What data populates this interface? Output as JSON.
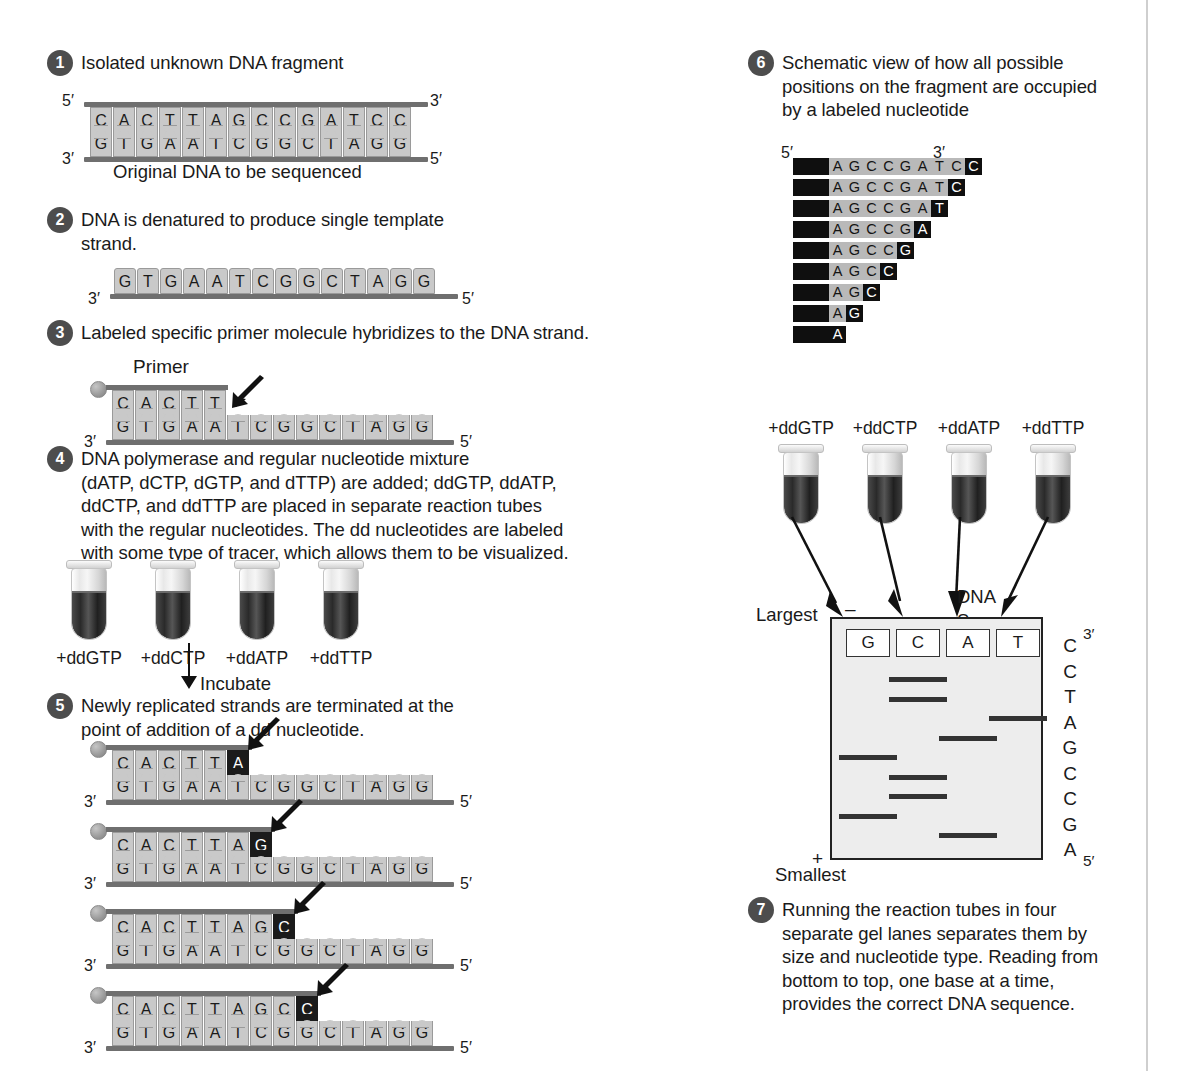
{
  "steps": {
    "s1": {
      "num": "1",
      "text": "Isolated unknown DNA fragment"
    },
    "s2": {
      "num": "2",
      "text": "DNA is denatured to produce single template\nstrand."
    },
    "s3": {
      "num": "3",
      "text": "Labeled specific primer molecule hybridizes to the DNA strand."
    },
    "s4": {
      "num": "4",
      "text": "DNA polymerase and regular nucleotide mixture\n(dATP, dCTP, dGTP, and dTTP) are added; ddGTP, ddATP,\nddCTP, and ddTTP are placed in separate reaction tubes\nwith the regular nucleotides. The dd nucleotides are labeled\nwith some type of tracer, which allows them to be visualized."
    },
    "s5": {
      "num": "5",
      "text": "Newly replicated strands are terminated at the\npoint of addition of a dd nucleotide."
    },
    "s6": {
      "num": "6",
      "text": "Schematic view of how all possible\npositions on the fragment are occupied\nby a labeled nucleotide"
    },
    "s7": {
      "num": "7",
      "text": "Running the reaction tubes in four\nseparate gel lanes separates them by\nsize and nucleotide type. Reading from\nbottom to top, one base at a time,\nprovides the correct DNA sequence."
    }
  },
  "labels": {
    "original_dna": "Original DNA to be sequenced",
    "primer": "Primer",
    "incubate": "Incubate",
    "largest": "Largest",
    "smallest": "Smallest",
    "dna_sequence": "DNA\nSequence",
    "five_prime": "5′",
    "three_prime": "3′",
    "minus": "–",
    "plus": "+"
  },
  "duplex": {
    "top": [
      "C",
      "A",
      "C",
      "T",
      "T",
      "A",
      "G",
      "C",
      "C",
      "G",
      "A",
      "T",
      "C",
      "C"
    ],
    "bottom": [
      "G",
      "T",
      "G",
      "A",
      "A",
      "T",
      "C",
      "G",
      "G",
      "C",
      "T",
      "A",
      "G",
      "G"
    ]
  },
  "template": {
    "bases": [
      "G",
      "T",
      "G",
      "A",
      "A",
      "T",
      "C",
      "G",
      "G",
      "C",
      "T",
      "A",
      "G",
      "G"
    ]
  },
  "primer_step3": {
    "primer_bases": [
      "C",
      "A",
      "C",
      "T",
      "T"
    ],
    "template_bases": [
      "G",
      "T",
      "G",
      "A",
      "A",
      "T",
      "C",
      "G",
      "G",
      "C",
      "T",
      "A",
      "G",
      "G"
    ]
  },
  "tubes": {
    "labels": [
      "+ddGTP",
      "+ddCTP",
      "+ddATP",
      "+ddTTP"
    ]
  },
  "step5_strands": [
    {
      "new": [
        "C",
        "A",
        "C",
        "T",
        "T",
        "A"
      ],
      "terminal_index": 5,
      "template": [
        "G",
        "T",
        "G",
        "A",
        "A",
        "T",
        "C",
        "G",
        "G",
        "C",
        "T",
        "A",
        "G",
        "G"
      ]
    },
    {
      "new": [
        "C",
        "A",
        "C",
        "T",
        "T",
        "A",
        "G"
      ],
      "terminal_index": 6,
      "template": [
        "G",
        "T",
        "G",
        "A",
        "A",
        "T",
        "C",
        "G",
        "G",
        "C",
        "T",
        "A",
        "G",
        "G"
      ]
    },
    {
      "new": [
        "C",
        "A",
        "C",
        "T",
        "T",
        "A",
        "G",
        "C"
      ],
      "terminal_index": 7,
      "template": [
        "G",
        "T",
        "G",
        "A",
        "A",
        "T",
        "C",
        "G",
        "G",
        "C",
        "T",
        "A",
        "G",
        "G"
      ]
    },
    {
      "new": [
        "C",
        "A",
        "C",
        "T",
        "T",
        "A",
        "G",
        "C",
        "C"
      ],
      "terminal_index": 8,
      "template": [
        "G",
        "T",
        "G",
        "A",
        "A",
        "T",
        "C",
        "G",
        "G",
        "C",
        "T",
        "A",
        "G",
        "G"
      ]
    }
  ],
  "step6_ladder": [
    {
      "seq": [
        "A",
        "G",
        "C",
        "C",
        "G",
        "A",
        "T",
        "C",
        "C"
      ],
      "terminal_index": 8
    },
    {
      "seq": [
        "A",
        "G",
        "C",
        "C",
        "G",
        "A",
        "T",
        "C"
      ],
      "terminal_index": 7
    },
    {
      "seq": [
        "A",
        "G",
        "C",
        "C",
        "G",
        "A",
        "T"
      ],
      "terminal_index": 6
    },
    {
      "seq": [
        "A",
        "G",
        "C",
        "C",
        "G",
        "A"
      ],
      "terminal_index": 5
    },
    {
      "seq": [
        "A",
        "G",
        "C",
        "C",
        "G"
      ],
      "terminal_index": 4
    },
    {
      "seq": [
        "A",
        "G",
        "C",
        "C"
      ],
      "terminal_index": 3
    },
    {
      "seq": [
        "A",
        "G",
        "C"
      ],
      "terminal_index": 2
    },
    {
      "seq": [
        "A",
        "G"
      ],
      "terminal_index": 1
    },
    {
      "seq": [
        "A"
      ],
      "terminal_index": 0
    }
  ],
  "chart_data": {
    "type": "table",
    "lanes": [
      "G",
      "C",
      "A",
      "T"
    ],
    "axis_top_label": "Largest",
    "axis_bottom_label": "Smallest",
    "electrode_top": "–",
    "electrode_bottom": "+",
    "bands": [
      {
        "lane": "C",
        "rank": 9
      },
      {
        "lane": "C",
        "rank": 8
      },
      {
        "lane": "T",
        "rank": 7
      },
      {
        "lane": "A",
        "rank": 6
      },
      {
        "lane": "G",
        "rank": 5
      },
      {
        "lane": "C",
        "rank": 4
      },
      {
        "lane": "C",
        "rank": 3
      },
      {
        "lane": "G",
        "rank": 2
      },
      {
        "lane": "A",
        "rank": 1
      }
    ],
    "read_sequence_top_to_bottom": [
      "C",
      "C",
      "T",
      "A",
      "G",
      "C",
      "C",
      "G",
      "A"
    ],
    "sequence_top_tick": "3′",
    "sequence_bottom_tick": "5′"
  },
  "sequence_readout": {
    "bases": [
      "C",
      "C",
      "T",
      "A",
      "G",
      "C",
      "C",
      "G",
      "A"
    ],
    "top_tick": "3′",
    "bottom_tick": "5′"
  }
}
